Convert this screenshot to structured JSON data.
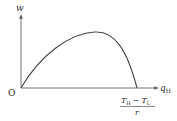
{
  "diagram": {
    "y_axis_label": "w",
    "x_axis_label_main": "q",
    "x_axis_label_sub": "H",
    "origin_label": "O",
    "intercept": {
      "numerator_T1": "T",
      "numerator_T1_sub": "H",
      "minus": "−",
      "numerator_T2": "T",
      "numerator_T2_sub": "L",
      "denominator": "r"
    },
    "curve": "concave-down arc from origin peaking then falling to x-intercept (T_H - T_L)/r",
    "colors": {
      "stroke": "#444444",
      "axis": "#666666"
    }
  }
}
